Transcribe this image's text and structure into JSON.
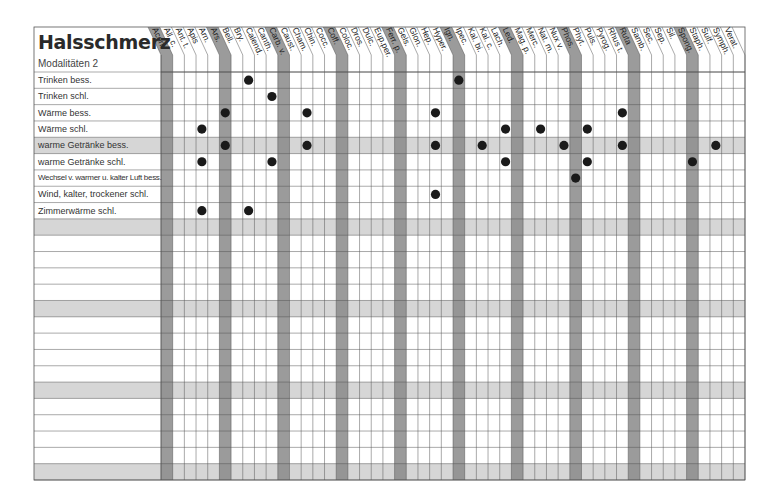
{
  "title": "Halsschmerz",
  "subtitle": "Modalitäten 2",
  "colors": {
    "band": "#8a8a8a",
    "shaded_row": "#d6d6d6",
    "grid": "#555555",
    "dot": "#1a1a1a"
  },
  "columns": [
    "Acon.",
    "All. c.",
    "Ant. t.",
    "Apis",
    "Arn.",
    "Ars.",
    "Bell.",
    "Bry.",
    "Calend.",
    "Canth.",
    "Carb. v.",
    "Caust.",
    "Cham.",
    "Chin.",
    "Cocc.",
    "Coff.",
    "Coloc.",
    "Dros.",
    "Dulc.",
    "Eup.per.",
    "Ferr. p.",
    "Gels.",
    "Glon.",
    "Hep.",
    "Hyper.",
    "Ign.",
    "Ipec.",
    "Kal. bi.",
    "Kal. c.",
    "Lach.",
    "Led.",
    "Mag. p.",
    "Merc.",
    "Nat. m.",
    "Nux v.",
    "Phos.",
    "Phyt.",
    "Puls.",
    "Pyrog.",
    "Rhus t.",
    "Ruta",
    "Samb.",
    "Sec.",
    "Sep.",
    "Sil.",
    "Spong.",
    "Staph.",
    "Sulf.",
    "Symph.",
    "Verat."
  ],
  "highlighted_columns": [
    0,
    5,
    10,
    15,
    20,
    25,
    30,
    35,
    40,
    45
  ],
  "rows": [
    {
      "label": "Trinken bess.",
      "marks": [
        7,
        25
      ]
    },
    {
      "label": "Trinken schl.",
      "marks": [
        9
      ]
    },
    {
      "label": "Wärme bess.",
      "marks": [
        5,
        12,
        23,
        39
      ]
    },
    {
      "label": "Wärme schl.",
      "marks": [
        3,
        29,
        32,
        36
      ]
    },
    {
      "label": "warme Getränke bess.",
      "marks": [
        5,
        12,
        23,
        27,
        34,
        39,
        47
      ]
    },
    {
      "label": "warme Getränke schl.",
      "marks": [
        3,
        9,
        29,
        36,
        45
      ]
    },
    {
      "label": "Wechsel v. warmer u. kalter Luft bess.",
      "marks": [
        35
      ]
    },
    {
      "label": "Wind, kalter, trockener schl.",
      "marks": [
        23
      ]
    },
    {
      "label": "Zimmerwärme schl.",
      "marks": [
        3,
        7
      ]
    },
    {
      "label": "",
      "marks": []
    },
    {
      "label": "",
      "marks": []
    },
    {
      "label": "",
      "marks": []
    },
    {
      "label": "",
      "marks": []
    },
    {
      "label": "",
      "marks": []
    },
    {
      "label": "",
      "marks": []
    },
    {
      "label": "",
      "marks": []
    },
    {
      "label": "",
      "marks": []
    },
    {
      "label": "",
      "marks": []
    },
    {
      "label": "",
      "marks": []
    },
    {
      "label": "",
      "marks": []
    },
    {
      "label": "",
      "marks": []
    },
    {
      "label": "",
      "marks": []
    },
    {
      "label": "",
      "marks": []
    },
    {
      "label": "",
      "marks": []
    },
    {
      "label": "",
      "marks": []
    }
  ],
  "shaded_rows": [
    4,
    9,
    14,
    19,
    24
  ]
}
